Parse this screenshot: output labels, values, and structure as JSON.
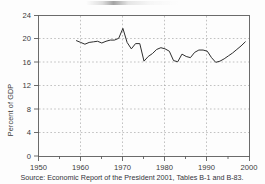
{
  "figure": {
    "background_color": "#fdfdfd",
    "line_color": "#2e2e2e",
    "grid_color": "#9a9a9a",
    "axis_color": "#6b6b6b",
    "title_partial": "",
    "source_note": "Source:  Economic Report of the President 2001, Tables B-1 and B-83."
  },
  "chart_data": {
    "type": "line",
    "title": "",
    "xlabel": "",
    "ylabel": "Percent of GDP",
    "xlim": [
      1950,
      2000
    ],
    "ylim": [
      0,
      24
    ],
    "xticks": [
      1950,
      1960,
      1970,
      1980,
      1990,
      2000
    ],
    "xticklabels": [
      "1950",
      "1960",
      "1970",
      "1980",
      "1990",
      "2000"
    ],
    "yticks": [
      0,
      4,
      8,
      12,
      16,
      20,
      24
    ],
    "yticklabels": [
      "0",
      "4",
      "8",
      "12",
      "16",
      "20",
      "24"
    ],
    "grid": "dotted both axes",
    "legend": "none",
    "series": [
      {
        "name": "Percent of GDP",
        "x": [
          1959,
          1960,
          1961,
          1962,
          1963,
          1964,
          1965,
          1966,
          1967,
          1968,
          1969,
          1970,
          1971,
          1972,
          1973,
          1974,
          1975,
          1976,
          1977,
          1978,
          1979,
          1980,
          1981,
          1982,
          1983,
          1984,
          1985,
          1986,
          1987,
          1988,
          1989,
          1990,
          1991,
          1992,
          1993,
          1994,
          1995,
          1996,
          1997,
          1998,
          1999
        ],
        "values": [
          19.7,
          19.4,
          19.1,
          19.4,
          19.5,
          19.6,
          19.3,
          19.6,
          19.8,
          19.8,
          20.1,
          21.8,
          19.4,
          18.3,
          19.2,
          19.2,
          16.2,
          17.0,
          17.5,
          18.2,
          18.5,
          18.3,
          17.9,
          16.3,
          16.1,
          17.4,
          17.0,
          16.8,
          17.7,
          18.1,
          18.1,
          17.9,
          16.8,
          16.0,
          16.2,
          16.6,
          17.1,
          17.6,
          18.2,
          18.8,
          19.5
        ]
      }
    ]
  }
}
